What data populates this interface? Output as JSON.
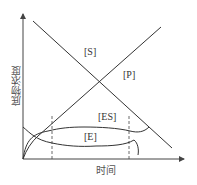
{
  "diagram": {
    "type": "enzyme-kinetics-concentration-time",
    "axes": {
      "y_label": "底物浓度",
      "x_label": "时间"
    },
    "curves": [
      {
        "id": "S",
        "label": "[S]",
        "description": "substrate concentration, decreasing linearly"
      },
      {
        "id": "P",
        "label": "[P]",
        "description": "product concentration, increasing linearly"
      },
      {
        "id": "ES",
        "label": "[ES]",
        "description": "enzyme-substrate complex, rises then plateaus then falls"
      },
      {
        "id": "E",
        "label": "[E]",
        "description": "free enzyme, falls then plateaus then rises"
      }
    ],
    "markers": [
      {
        "id": "steady-state-start",
        "style": "dashed"
      },
      {
        "id": "steady-state-end",
        "style": "dashed"
      }
    ],
    "colors": {
      "line": "#333333",
      "axis": "#444444",
      "background": "#ffffff"
    }
  }
}
